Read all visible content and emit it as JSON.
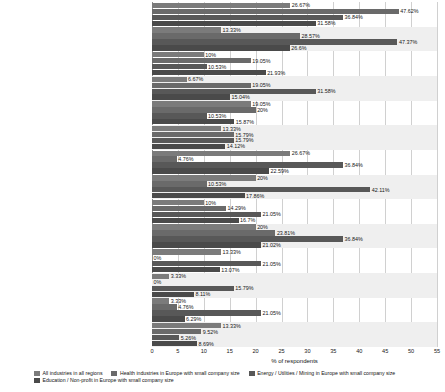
{
  "chart_data": {
    "type": "bar",
    "orientation": "horizontal",
    "title": "",
    "xlabel": "% of respondents",
    "ylabel": "",
    "xlim": [
      0,
      55
    ],
    "xticks": [
      "0",
      "5",
      "10",
      "15",
      "20",
      "25",
      "30",
      "35",
      "40",
      "45",
      "50",
      "55"
    ],
    "grid": true,
    "legend_position": "bottom-left",
    "value_suffix": "%",
    "categories": [
      "Current employees",
      "Former employees",
      "Current service providers/consultants/contractors",
      "Former service providers/consultants/contractors",
      "Suppliers/business partners",
      "Customers",
      "Hackers",
      "Organized crime",
      "Activists/hacktivists",
      "Competitors",
      "Foreign entities and organizations",
      "Foreign nation-states",
      "Domestic intelligence service",
      "Do not know"
    ],
    "series": [
      {
        "name": "All industries in all regions",
        "color": "#7b7b7b",
        "values": [
          26.67,
          13.33,
          10,
          6.67,
          19.05,
          13.33,
          26.67,
          20,
          10,
          20,
          13.33,
          3.33,
          3.33,
          13.33
        ],
        "labels": [
          "26.67%",
          "13.33%",
          "10%",
          "6.67%",
          "19.05%",
          "13.33%",
          "26.67%",
          "20%",
          "10%",
          "20%",
          "13.33%",
          "3.33%",
          "3.33%",
          "13.33%"
        ]
      },
      {
        "name": "Health industries in Europe with small company size",
        "color": "#6a6a6a",
        "values": [
          47.62,
          28.57,
          19.05,
          19.05,
          20,
          15.79,
          4.76,
          10.53,
          14.29,
          23.81,
          0,
          0,
          4.76,
          9.52
        ],
        "labels": [
          "47.62%",
          "28.57%",
          "19.05%",
          "19.05%",
          "20%",
          "15.79%",
          "4.76%",
          "10.53%",
          "14.29%",
          "23.81%",
          "0%",
          "0%",
          "4.76%",
          "9.52%"
        ]
      },
      {
        "name": "Energy / Utilities / Mining in Europe with small company size",
        "color": "#585858",
        "values": [
          36.84,
          47.37,
          10.53,
          31.58,
          10.53,
          15.79,
          36.84,
          42.11,
          21.05,
          36.84,
          21.05,
          15.79,
          21.05,
          5.26
        ],
        "labels": [
          "36.84%",
          "47.37%",
          "10.53%",
          "31.58%",
          "10.53%",
          "15.79%",
          "36.84%",
          "42.11%",
          "21.05%",
          "36.84%",
          "21.05%",
          "15.79%",
          "21.05%",
          "5.26%"
        ]
      },
      {
        "name": "Education / Non-profit in Europe with small company size",
        "color": "#4a4a4a",
        "values": [
          31.58,
          26.6,
          21.93,
          15.04,
          15.87,
          14.12,
          22.59,
          17.86,
          16.7,
          21.02,
          13.07,
          8.11,
          6.29,
          8.69
        ],
        "labels": [
          "31.58%",
          "26.6%",
          "21.93%",
          "15.04%",
          "15.87%",
          "14.12%",
          "22.59%",
          "17.86%",
          "16.7%",
          "21.02%",
          "13.07%",
          "8.11%",
          "6.29%",
          "8.69%"
        ]
      }
    ]
  }
}
